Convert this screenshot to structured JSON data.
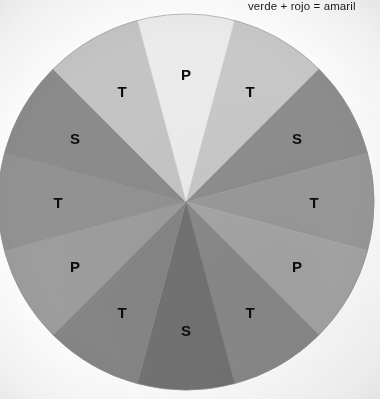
{
  "caption": {
    "text": "verde + rojo = amaril",
    "note_truncated": true
  },
  "wheel": {
    "center_x": 186,
    "center_y": 202,
    "radius": 188,
    "segment_count": 12,
    "segment_angle_deg": 30,
    "start_angle_deg": -105,
    "label_radius": 128,
    "outline_color": "#8e8e8e",
    "segments": [
      {
        "label": "P",
        "color": "#ebebeb",
        "angle_center_deg": -90
      },
      {
        "label": "T",
        "color": "#c8c8c8",
        "angle_center_deg": -60
      },
      {
        "label": "S",
        "color": "#8e8e8e",
        "angle_center_deg": -30
      },
      {
        "label": "T",
        "color": "#9a9a9a",
        "angle_center_deg": 0
      },
      {
        "label": "P",
        "color": "#a6a6a6",
        "angle_center_deg": 30
      },
      {
        "label": "T",
        "color": "#8a8a8a",
        "angle_center_deg": 60
      },
      {
        "label": "S",
        "color": "#737373",
        "angle_center_deg": 90
      },
      {
        "label": "T",
        "color": "#868686",
        "angle_center_deg": 120
      },
      {
        "label": "P",
        "color": "#9d9d9d",
        "angle_center_deg": 150
      },
      {
        "label": "T",
        "color": "#929292",
        "angle_center_deg": 180
      },
      {
        "label": "S",
        "color": "#8b8b8b",
        "angle_center_deg": 210
      },
      {
        "label": "T",
        "color": "#c4c4c4",
        "angle_center_deg": 240
      }
    ]
  },
  "chart_data": {
    "type": "pie",
    "title": "",
    "subtitle": "verde + rojo = amaril",
    "xlabel": "",
    "ylabel": "",
    "legend_position": "none",
    "grid": false,
    "categories": [
      "P",
      "T",
      "S",
      "T",
      "P",
      "T",
      "S",
      "T",
      "P",
      "T",
      "S",
      "T"
    ],
    "values": [
      30,
      30,
      30,
      30,
      30,
      30,
      30,
      30,
      30,
      30,
      30,
      30
    ],
    "units": "degrees",
    "colors": [
      "#ebebeb",
      "#c8c8c8",
      "#8e8e8e",
      "#9a9a9a",
      "#a6a6a6",
      "#8a8a8a",
      "#737373",
      "#868686",
      "#9d9d9d",
      "#929292",
      "#8b8b8b",
      "#c4c4c4"
    ],
    "annotations": [
      "verde + rojo = amaril"
    ]
  }
}
